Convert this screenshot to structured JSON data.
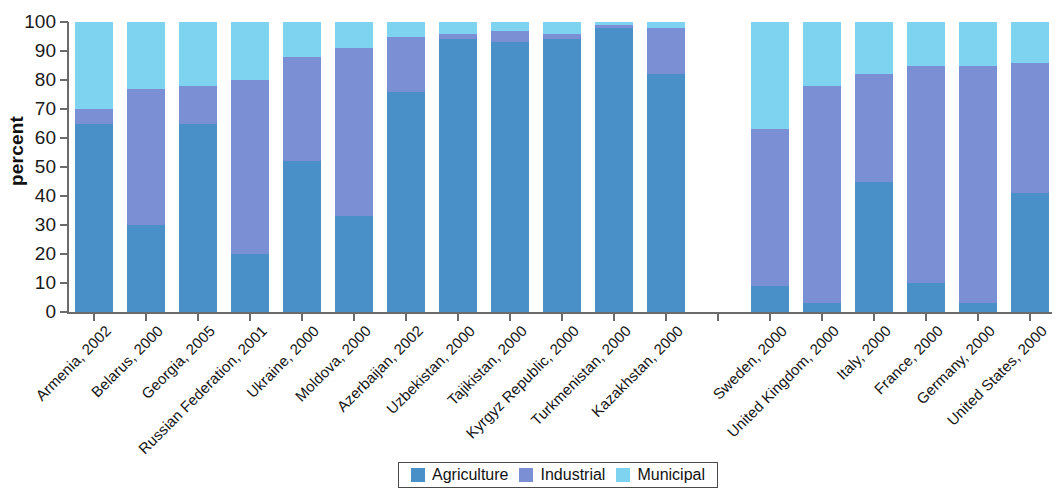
{
  "chart_data": {
    "type": "bar",
    "subtype": "stacked-100-percent",
    "title": "",
    "xlabel": "",
    "ylabel": "percent",
    "ylim": [
      0,
      100
    ],
    "ytick_labels": [
      "100",
      "90",
      "80",
      "70",
      "60",
      "50",
      "40",
      "30",
      "20",
      "10",
      "0"
    ],
    "ytick_values": [
      100,
      90,
      80,
      70,
      60,
      50,
      40,
      30,
      20,
      10,
      0
    ],
    "grid": false,
    "legend_position": "bottom-center",
    "categories": [
      "Armenia, 2002",
      "Belarus, 2000",
      "Georgia, 2005",
      "Russian Federation, 2001",
      "Ukraine, 2000",
      "Moldova, 2000",
      "Azerbaijan, 2002",
      "Uzbekistan, 2000",
      "Tajikistan, 2000",
      "Kyrgyz Republic, 2000",
      "Turkmenistan, 2000",
      "Kazakhstan, 2000",
      "",
      "Sweden, 2000",
      "United Kingdom, 2000",
      "Italy, 2000",
      "France, 2000",
      "Germany, 2000",
      "United States, 2000"
    ],
    "series": [
      {
        "name": "Agriculture",
        "color": "#4a90c8",
        "values": [
          65,
          30,
          65,
          20,
          52,
          33,
          76,
          94,
          93,
          94,
          98,
          82,
          null,
          9,
          3,
          45,
          10,
          3,
          41
        ]
      },
      {
        "name": "Industrial",
        "color": "#7b8fd4",
        "values": [
          5,
          47,
          13,
          60,
          36,
          58,
          19,
          2,
          4,
          2,
          1,
          16,
          null,
          54,
          75,
          37,
          75,
          82,
          45
        ]
      },
      {
        "name": "Municipal",
        "color": "#7ed4f0",
        "values": [
          30,
          23,
          22,
          20,
          12,
          9,
          5,
          4,
          3,
          4,
          1,
          2,
          null,
          37,
          22,
          18,
          15,
          15,
          14
        ]
      }
    ],
    "cumulative_tops": {
      "agriculture": [
        65,
        30,
        65,
        20,
        52,
        33,
        76,
        94,
        93,
        94,
        98,
        82,
        null,
        9,
        3,
        45,
        10,
        3,
        41
      ],
      "industrial": [
        70,
        77,
        78,
        80,
        88,
        91,
        95,
        96,
        97,
        96,
        99,
        98,
        null,
        63,
        78,
        82,
        85,
        85,
        86
      ],
      "municipal": [
        100,
        100,
        100,
        100,
        100,
        100,
        100,
        100,
        100,
        100,
        100,
        100,
        null,
        100,
        100,
        100,
        100,
        100,
        100
      ]
    }
  },
  "legend": {
    "items": [
      {
        "label": "Agriculture",
        "color": "#4a90c8"
      },
      {
        "label": "Industrial",
        "color": "#7b8fd4"
      },
      {
        "label": "Municipal",
        "color": "#7ed4f0"
      }
    ]
  },
  "axis": {
    "y_title": "percent"
  }
}
